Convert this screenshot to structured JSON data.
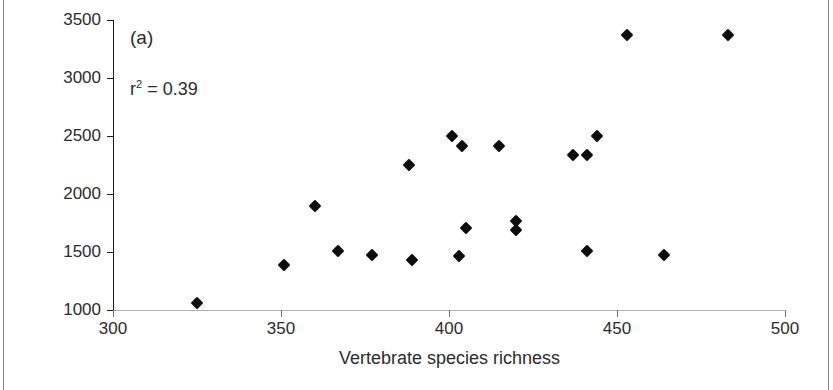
{
  "figure": {
    "panel_label": "(a)",
    "annotation_prefix": "r",
    "annotation_sup": "2",
    "annotation_suffix": " = 0.39",
    "marker_color": "#0d0d0d",
    "axis_color": "#1a1a1a",
    "text_color": "#2b2b2b"
  },
  "chart_data": {
    "type": "scatter",
    "title": "(a)",
    "xlabel": "Vertebrate species richness",
    "ylabel": "Plant species richness",
    "xlim": [
      300,
      500
    ],
    "ylim": [
      1000,
      3500
    ],
    "xticks": [
      300,
      350,
      400,
      450,
      500
    ],
    "yticks": [
      1000,
      1500,
      2000,
      2500,
      3000,
      3500
    ],
    "grid": false,
    "legend": null,
    "annotations": [
      {
        "text": "(a)",
        "kind": "panel-label"
      },
      {
        "text": "r2 = 0.39",
        "kind": "statistic",
        "r_squared": 0.39
      }
    ],
    "series": [
      {
        "name": "sites",
        "marker": "diamond",
        "color": "#0d0d0d",
        "points": [
          {
            "x": 325,
            "y": 1060
          },
          {
            "x": 351,
            "y": 1390
          },
          {
            "x": 360,
            "y": 1900
          },
          {
            "x": 367,
            "y": 1510
          },
          {
            "x": 377,
            "y": 1470
          },
          {
            "x": 388,
            "y": 2250
          },
          {
            "x": 389,
            "y": 1430
          },
          {
            "x": 401,
            "y": 2500
          },
          {
            "x": 404,
            "y": 2410
          },
          {
            "x": 403,
            "y": 1465
          },
          {
            "x": 405,
            "y": 1710
          },
          {
            "x": 415,
            "y": 2410
          },
          {
            "x": 420,
            "y": 1765
          },
          {
            "x": 420,
            "y": 1690
          },
          {
            "x": 437,
            "y": 2340
          },
          {
            "x": 441,
            "y": 2335
          },
          {
            "x": 444,
            "y": 2500
          },
          {
            "x": 441,
            "y": 1510
          },
          {
            "x": 453,
            "y": 3375
          },
          {
            "x": 464,
            "y": 1475
          },
          {
            "x": 483,
            "y": 3370
          }
        ]
      }
    ]
  }
}
